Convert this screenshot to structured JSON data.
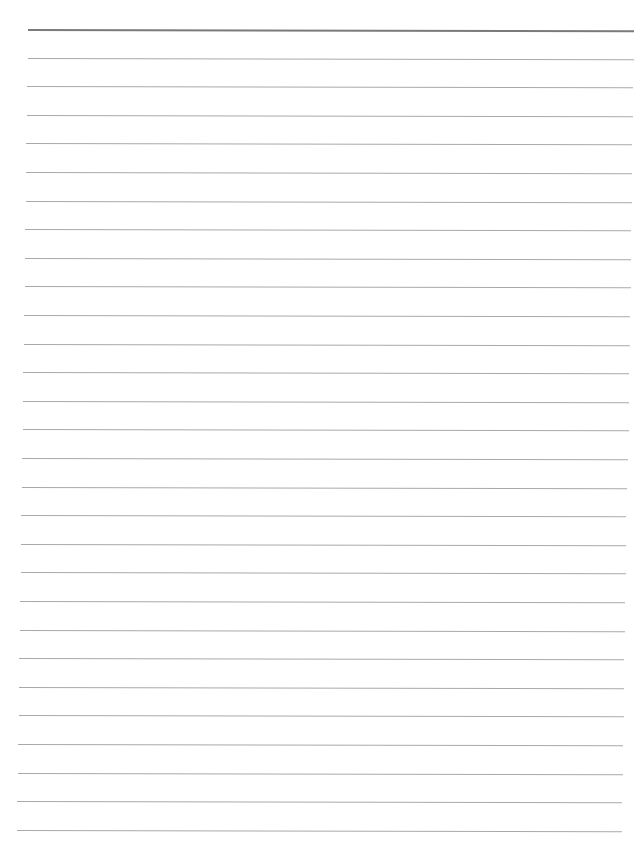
{
  "document": {
    "type": "lined-paper",
    "text_content": "",
    "colors": {
      "paper": "#ffffff",
      "rule": "#a9a9a9",
      "header_rule": "#7a7a7a"
    },
    "rules": {
      "count": 29,
      "first_y": 29,
      "spacing": 28.6,
      "left_top": 28,
      "left_bottom": 17,
      "right_top": 634,
      "right_bottom": 622,
      "header_rule_index": 0
    }
  }
}
